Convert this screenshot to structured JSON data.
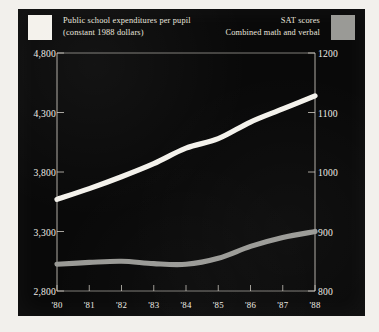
{
  "legend": {
    "left": {
      "swatch_name": "expenditures-swatch",
      "swatch_color": "#f4f2ec",
      "line1": "Public school expenditures per pupil",
      "line2": "(constant 1988 dollars)"
    },
    "right": {
      "swatch_name": "sat-swatch",
      "swatch_color": "#9a9a96",
      "line1": "SAT scores",
      "line2": "Combined math and verbal"
    }
  },
  "chart_data": {
    "type": "line",
    "title": "",
    "xlabel": "",
    "ylabel": "",
    "grid": false,
    "legend_position": "top",
    "background": "#090909",
    "x": [
      "'80",
      "'81",
      "'82",
      "'83",
      "'84",
      "'85",
      "'86",
      "'87",
      "'88"
    ],
    "axes": {
      "left": {
        "label": "Public school expenditures per pupil (constant 1988 dollars)",
        "ticks": [
          "4,800",
          "4,300",
          "3,800",
          "3,300",
          "2,800"
        ],
        "tick_values": [
          4800,
          4300,
          3800,
          3300,
          2800
        ],
        "ylim": [
          2800,
          4800
        ],
        "color": "#f4f2ec"
      },
      "right": {
        "label": "SAT scores Combined math and verbal",
        "ticks": [
          "1200",
          "1100",
          "1000",
          "900",
          "800"
        ],
        "tick_values": [
          1200,
          1100,
          1000,
          900,
          800
        ],
        "ylim": [
          800,
          1200
        ],
        "color": "#9a9a96"
      }
    },
    "series": [
      {
        "name": "Public school expenditures per pupil",
        "axis": "left",
        "color": "#f4f2ec",
        "values": [
          3570,
          3660,
          3760,
          3870,
          4000,
          4080,
          4220,
          4330,
          4440
        ]
      },
      {
        "name": "SAT scores",
        "axis": "right",
        "color": "#9a9a96",
        "values": [
          845,
          848,
          850,
          846,
          845,
          855,
          875,
          890,
          900
        ]
      }
    ]
  }
}
